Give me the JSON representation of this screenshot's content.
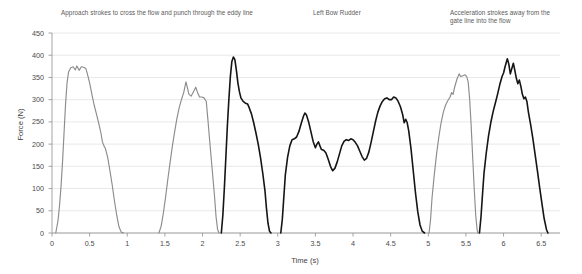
{
  "chart_data": {
    "type": "line",
    "title": "",
    "xlabel": "Time (s)",
    "ylabel": "Force (N)",
    "xlim": [
      0,
      6.75
    ],
    "ylim": [
      0,
      450
    ],
    "grid": true,
    "legend_position": "none",
    "xticks": [
      "0",
      "0.5",
      "1",
      "1.5",
      "2",
      "2.5",
      "3",
      "3.5",
      "4",
      "4.5",
      "5",
      "5.5",
      "6",
      "6.5"
    ],
    "xtick_values": [
      0,
      0.5,
      1,
      1.5,
      2,
      2.5,
      3,
      3.5,
      4,
      4.5,
      5,
      5.5,
      6,
      6.5
    ],
    "yticks": [
      "0",
      "50",
      "100",
      "150",
      "200",
      "250",
      "300",
      "350",
      "400",
      "450"
    ],
    "ytick_values": [
      0,
      50,
      100,
      150,
      200,
      250,
      300,
      350,
      400,
      450
    ],
    "colors": {
      "gray_stroke": "#8c8c8c",
      "black_stroke": "#151515",
      "grid": "#e2e2e2",
      "axis": "#9a9a9a"
    },
    "annotations": [
      {
        "text": "Approach strokes to cross the flow and punch through the eddy line",
        "x": 0.45
      },
      {
        "text": "Left Bow Rudder",
        "x": 3.55
      },
      {
        "text": "Acceleration strokes away from the\ngate line into the flow",
        "x": 5.6
      }
    ],
    "series": [
      {
        "name": "approach-stroke-1",
        "color": "gray",
        "points": [
          [
            0.05,
            0
          ],
          [
            0.08,
            28
          ],
          [
            0.1,
            62
          ],
          [
            0.12,
            105
          ],
          [
            0.14,
            160
          ],
          [
            0.16,
            225
          ],
          [
            0.18,
            290
          ],
          [
            0.2,
            338
          ],
          [
            0.22,
            362
          ],
          [
            0.25,
            372
          ],
          [
            0.28,
            374
          ],
          [
            0.31,
            367
          ],
          [
            0.33,
            376
          ],
          [
            0.36,
            366
          ],
          [
            0.39,
            374
          ],
          [
            0.42,
            373
          ],
          [
            0.45,
            370
          ],
          [
            0.47,
            358
          ],
          [
            0.5,
            338
          ],
          [
            0.53,
            312
          ],
          [
            0.56,
            288
          ],
          [
            0.59,
            268
          ],
          [
            0.62,
            248
          ],
          [
            0.65,
            225
          ],
          [
            0.67,
            205
          ],
          [
            0.69,
            196
          ],
          [
            0.71,
            190
          ],
          [
            0.74,
            170
          ],
          [
            0.77,
            140
          ],
          [
            0.8,
            108
          ],
          [
            0.83,
            72
          ],
          [
            0.86,
            40
          ],
          [
            0.89,
            14
          ],
          [
            0.92,
            2
          ],
          [
            0.95,
            0
          ]
        ]
      },
      {
        "name": "approach-stroke-2",
        "color": "gray",
        "points": [
          [
            1.42,
            0
          ],
          [
            1.45,
            15
          ],
          [
            1.48,
            45
          ],
          [
            1.51,
            82
          ],
          [
            1.54,
            122
          ],
          [
            1.57,
            160
          ],
          [
            1.6,
            196
          ],
          [
            1.63,
            228
          ],
          [
            1.66,
            258
          ],
          [
            1.69,
            282
          ],
          [
            1.72,
            300
          ],
          [
            1.75,
            316
          ],
          [
            1.78,
            340
          ],
          [
            1.8,
            326
          ],
          [
            1.82,
            312
          ],
          [
            1.85,
            308
          ],
          [
            1.88,
            318
          ],
          [
            1.91,
            328
          ],
          [
            1.93,
            318
          ],
          [
            1.96,
            306
          ],
          [
            1.99,
            306
          ],
          [
            2.02,
            304
          ],
          [
            2.05,
            296
          ],
          [
            2.07,
            258
          ],
          [
            2.1,
            198
          ],
          [
            2.13,
            140
          ],
          [
            2.16,
            82
          ],
          [
            2.18,
            36
          ],
          [
            2.2,
            8
          ],
          [
            2.22,
            0
          ]
        ]
      },
      {
        "name": "punch-through-eddy-line",
        "color": "black",
        "points": [
          [
            2.25,
            0
          ],
          [
            2.27,
            40
          ],
          [
            2.29,
            100
          ],
          [
            2.31,
            170
          ],
          [
            2.33,
            240
          ],
          [
            2.35,
            300
          ],
          [
            2.37,
            352
          ],
          [
            2.39,
            386
          ],
          [
            2.41,
            396
          ],
          [
            2.43,
            390
          ],
          [
            2.45,
            366
          ],
          [
            2.47,
            338
          ],
          [
            2.49,
            318
          ],
          [
            2.51,
            304
          ],
          [
            2.54,
            296
          ],
          [
            2.57,
            292
          ],
          [
            2.6,
            290
          ],
          [
            2.62,
            282
          ],
          [
            2.65,
            268
          ],
          [
            2.68,
            248
          ],
          [
            2.71,
            225
          ],
          [
            2.74,
            200
          ],
          [
            2.77,
            170
          ],
          [
            2.8,
            135
          ],
          [
            2.83,
            95
          ],
          [
            2.85,
            55
          ],
          [
            2.87,
            22
          ],
          [
            2.89,
            4
          ],
          [
            2.91,
            0
          ]
        ]
      },
      {
        "name": "left-bow-rudder",
        "color": "black",
        "points": [
          [
            3.04,
            0
          ],
          [
            3.06,
            30
          ],
          [
            3.08,
            80
          ],
          [
            3.1,
            130
          ],
          [
            3.13,
            170
          ],
          [
            3.16,
            196
          ],
          [
            3.19,
            210
          ],
          [
            3.22,
            212
          ],
          [
            3.25,
            216
          ],
          [
            3.28,
            228
          ],
          [
            3.31,
            246
          ],
          [
            3.34,
            262
          ],
          [
            3.36,
            270
          ],
          [
            3.38,
            266
          ],
          [
            3.41,
            250
          ],
          [
            3.44,
            228
          ],
          [
            3.47,
            206
          ],
          [
            3.5,
            192
          ],
          [
            3.52,
            200
          ],
          [
            3.54,
            205
          ],
          [
            3.56,
            196
          ],
          [
            3.58,
            188
          ],
          [
            3.61,
            186
          ],
          [
            3.64,
            180
          ],
          [
            3.67,
            166
          ],
          [
            3.7,
            150
          ],
          [
            3.73,
            140
          ],
          [
            3.76,
            146
          ],
          [
            3.79,
            160
          ],
          [
            3.82,
            178
          ],
          [
            3.85,
            196
          ],
          [
            3.88,
            206
          ],
          [
            3.91,
            210
          ],
          [
            3.94,
            208
          ],
          [
            3.97,
            212
          ],
          [
            4.0,
            210
          ],
          [
            4.03,
            204
          ],
          [
            4.06,
            196
          ],
          [
            4.09,
            184
          ],
          [
            4.12,
            172
          ],
          [
            4.15,
            164
          ],
          [
            4.18,
            168
          ],
          [
            4.21,
            182
          ],
          [
            4.24,
            204
          ],
          [
            4.27,
            228
          ],
          [
            4.3,
            252
          ],
          [
            4.33,
            272
          ],
          [
            4.36,
            286
          ],
          [
            4.39,
            296
          ],
          [
            4.42,
            302
          ],
          [
            4.45,
            304
          ],
          [
            4.48,
            300
          ],
          [
            4.51,
            300
          ],
          [
            4.54,
            306
          ],
          [
            4.57,
            304
          ],
          [
            4.6,
            296
          ],
          [
            4.63,
            284
          ],
          [
            4.66,
            266
          ],
          [
            4.68,
            248
          ],
          [
            4.7,
            256
          ],
          [
            4.72,
            248
          ],
          [
            4.74,
            230
          ],
          [
            4.77,
            190
          ],
          [
            4.8,
            140
          ],
          [
            4.83,
            90
          ],
          [
            4.86,
            48
          ],
          [
            4.89,
            18
          ],
          [
            4.92,
            4
          ],
          [
            4.95,
            0
          ]
        ]
      },
      {
        "name": "acceleration-stroke-gray",
        "color": "gray",
        "points": [
          [
            5.01,
            0
          ],
          [
            5.03,
            30
          ],
          [
            5.05,
            80
          ],
          [
            5.08,
            132
          ],
          [
            5.11,
            178
          ],
          [
            5.14,
            216
          ],
          [
            5.17,
            248
          ],
          [
            5.2,
            272
          ],
          [
            5.23,
            288
          ],
          [
            5.26,
            298
          ],
          [
            5.29,
            306
          ],
          [
            5.31,
            316
          ],
          [
            5.33,
            312
          ],
          [
            5.35,
            328
          ],
          [
            5.38,
            346
          ],
          [
            5.41,
            358
          ],
          [
            5.43,
            352
          ],
          [
            5.46,
            354
          ],
          [
            5.49,
            356
          ],
          [
            5.51,
            352
          ],
          [
            5.53,
            340
          ],
          [
            5.55,
            300
          ],
          [
            5.57,
            240
          ],
          [
            5.59,
            170
          ],
          [
            5.61,
            100
          ],
          [
            5.63,
            40
          ],
          [
            5.65,
            6
          ],
          [
            5.66,
            0
          ]
        ]
      },
      {
        "name": "acceleration-stroke-black",
        "color": "black",
        "points": [
          [
            5.68,
            0
          ],
          [
            5.7,
            36
          ],
          [
            5.72,
            86
          ],
          [
            5.74,
            134
          ],
          [
            5.77,
            180
          ],
          [
            5.8,
            218
          ],
          [
            5.83,
            248
          ],
          [
            5.86,
            272
          ],
          [
            5.89,
            292
          ],
          [
            5.92,
            312
          ],
          [
            5.95,
            334
          ],
          [
            5.98,
            352
          ],
          [
            6.0,
            360
          ],
          [
            6.02,
            374
          ],
          [
            6.05,
            392
          ],
          [
            6.07,
            380
          ],
          [
            6.09,
            358
          ],
          [
            6.11,
            370
          ],
          [
            6.13,
            382
          ],
          [
            6.15,
            366
          ],
          [
            6.17,
            348
          ],
          [
            6.19,
            336
          ],
          [
            6.21,
            344
          ],
          [
            6.23,
            330
          ],
          [
            6.25,
            312
          ],
          [
            6.27,
            302
          ],
          [
            6.29,
            306
          ],
          [
            6.31,
            296
          ],
          [
            6.33,
            272
          ],
          [
            6.36,
            244
          ],
          [
            6.39,
            212
          ],
          [
            6.42,
            176
          ],
          [
            6.45,
            140
          ],
          [
            6.48,
            102
          ],
          [
            6.51,
            66
          ],
          [
            6.54,
            32
          ],
          [
            6.57,
            8
          ],
          [
            6.59,
            0
          ]
        ]
      }
    ]
  }
}
